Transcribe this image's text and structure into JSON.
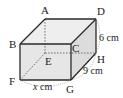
{
  "figure": {
    "type": "cuboid",
    "vertices": {
      "A": {
        "label": "A",
        "x": 45,
        "y": 19
      },
      "B": {
        "label": "B",
        "x": 20,
        "y": 44
      },
      "C": {
        "label": "C",
        "x": 71,
        "y": 44
      },
      "D": {
        "label": "D",
        "x": 96,
        "y": 19
      },
      "E": {
        "label": "E",
        "x": 45,
        "y": 53
      },
      "F": {
        "label": "F",
        "x": 20,
        "y": 80
      },
      "G": {
        "label": "G",
        "x": 71,
        "y": 80
      },
      "H": {
        "label": "H",
        "x": 96,
        "y": 53
      }
    },
    "dimensions": {
      "height_DH": {
        "value": "6",
        "unit": "cm",
        "text": "6 cm"
      },
      "depth_GH": {
        "value": "9",
        "unit": "cm",
        "text": "9 cm"
      },
      "width_FG": {
        "var": "x",
        "unit": "cm",
        "text_var": "x",
        "text_unit": " cm"
      }
    },
    "colors": {
      "edge": "#2a2a2a",
      "hidden_edge": "#555555",
      "front_face": "#e6e6e6",
      "top_face": "#eeeeee",
      "side_face": "#dcdcdc",
      "dim_arc": "#888888"
    }
  }
}
